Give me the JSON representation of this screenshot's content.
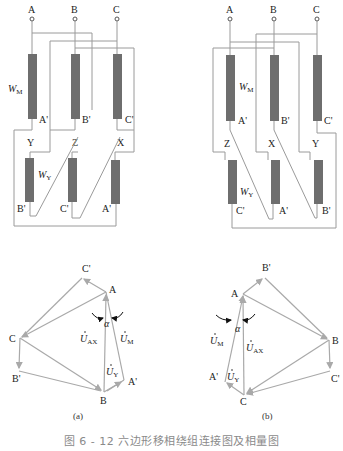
{
  "figure": {
    "caption": "图 6 - 12   六边形移相绕组连接图及相量图",
    "panels": [
      {
        "id": "a",
        "label": "(a)",
        "terminals": [
          "A",
          "B",
          "C"
        ],
        "main_winding_label": "W",
        "main_winding_sub": "M",
        "series_winding_label": "W",
        "series_winding_sub": "Y",
        "upper_coil_end_labels": [
          "A'",
          "B'",
          "C'"
        ],
        "mid_labels": [
          "Y",
          "Z",
          "X"
        ],
        "lower_coil_end_labels": [
          "B'",
          "C'",
          "A'"
        ],
        "phasor": {
          "points": [
            "C'",
            "A",
            "C",
            "B'",
            "B",
            "A'"
          ],
          "vector_labels": {
            "uax": "U",
            "uax_sub": "AX",
            "um": "U",
            "um_sub": "M",
            "uy": "U",
            "uy_sub": "Y"
          },
          "angle_label": "α"
        }
      },
      {
        "id": "b",
        "label": "(b)",
        "terminals": [
          "A",
          "B",
          "C"
        ],
        "main_winding_label": "W",
        "main_winding_sub": "M",
        "series_winding_label": "W",
        "series_winding_sub": "Y",
        "upper_coil_end_labels": [
          "A'",
          "B'",
          "C'"
        ],
        "mid_labels": [
          "Z",
          "X",
          "Y"
        ],
        "lower_coil_end_labels": [
          "C'",
          "A'",
          "B'"
        ],
        "phasor": {
          "points": [
            "B'",
            "A",
            "B",
            "C'",
            "C",
            "A'"
          ],
          "vector_labels": {
            "uax": "U",
            "uax_sub": "AX",
            "um": "U",
            "um_sub": "M",
            "uy": "U",
            "uy_sub": "Y"
          },
          "angle_label": "α"
        }
      }
    ]
  }
}
